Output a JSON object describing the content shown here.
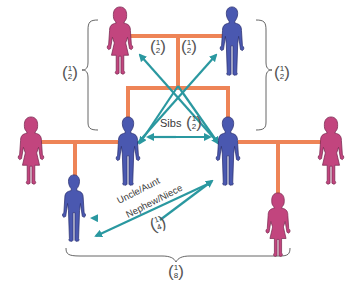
{
  "colors": {
    "female": "#c2457e",
    "male": "#4a58b0",
    "line": "#ee8457",
    "arrow": "#2a98a0",
    "text": "#3a3a3a"
  },
  "people": [
    {
      "id": "grandmother",
      "sex": "female",
      "generation": 1
    },
    {
      "id": "grandfather",
      "sex": "male",
      "generation": 1
    },
    {
      "id": "aunt-in-law-left",
      "sex": "female",
      "generation": 2
    },
    {
      "id": "parent-left",
      "sex": "male",
      "generation": 2
    },
    {
      "id": "parent-right",
      "sex": "male",
      "generation": 2
    },
    {
      "id": "spouse-right",
      "sex": "female",
      "generation": 2
    },
    {
      "id": "child-left",
      "sex": "male",
      "generation": 3
    },
    {
      "id": "child-right",
      "sex": "female",
      "generation": 3
    }
  ],
  "labels": {
    "parent_child_left": {
      "num": "1",
      "den": "2"
    },
    "parent_child_right": {
      "num": "1",
      "den": "2"
    },
    "grandparent_center_left": {
      "num": "1",
      "den": "2"
    },
    "grandparent_center_right": {
      "num": "1",
      "den": "2"
    },
    "sibs": {
      "text": "Sibs",
      "num": "1",
      "den": "2"
    },
    "uncle": {
      "line1": "Uncle/Aunt",
      "line2": "Nephew/Niece",
      "num": "1",
      "den": "4"
    },
    "cousins": {
      "num": "1",
      "den": "8"
    }
  }
}
